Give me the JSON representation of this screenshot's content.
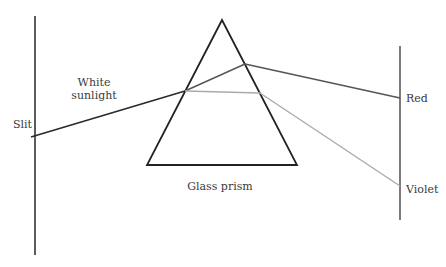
{
  "diagram": {
    "labels": {
      "white_sunlight_line1": "White",
      "white_sunlight_line2": "sunlight",
      "slit": "Slit",
      "prism": "Glass prism",
      "red": "Red",
      "violet": "Violet"
    },
    "colors": {
      "prism": "#222222",
      "incoming_ray": "#2a2a2a",
      "red_ray": "#555555",
      "violet_ray": "#aaaaaa",
      "slit": "#333333",
      "screen": "#444444"
    }
  }
}
